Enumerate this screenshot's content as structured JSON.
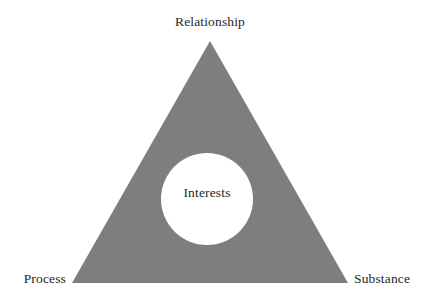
{
  "diagram": {
    "type": "triangle-with-center-circle",
    "canvas": {
      "width": 436,
      "height": 304,
      "background": "#ffffff"
    },
    "shape": {
      "triangle": {
        "fill": "#808080",
        "texture": "subtle-noise-grain",
        "apex": {
          "x": 210,
          "y": 41
        },
        "bottom_left": {
          "x": 72,
          "y": 283
        },
        "bottom_right": {
          "x": 348,
          "y": 283
        }
      },
      "circle": {
        "fill": "#ffffff",
        "center": {
          "x": 207,
          "y": 199
        },
        "radius": 46
      }
    },
    "labels": {
      "apex": "Relationship",
      "bottom_left": "Process",
      "bottom_right": "Substance",
      "center": "Interests"
    },
    "label_color": "#262626"
  }
}
